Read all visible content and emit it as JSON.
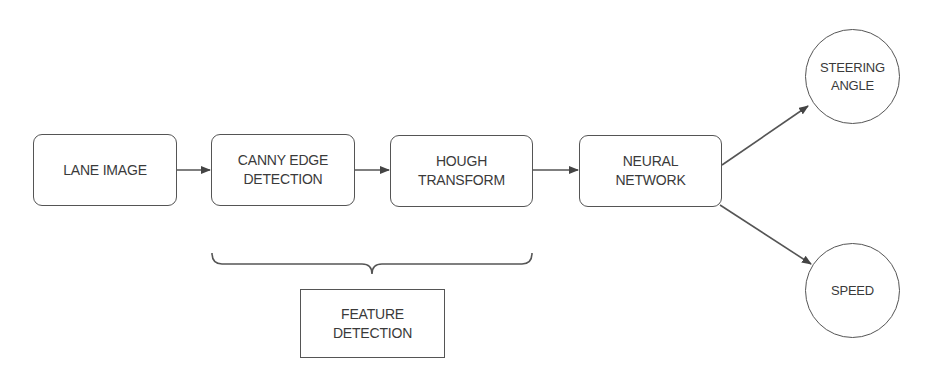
{
  "diagram": {
    "type": "flowchart",
    "nodes": [
      {
        "id": "lane_image",
        "label": "LANE IMAGE",
        "shape": "rounded-rect"
      },
      {
        "id": "canny",
        "label": "CANNY EDGE\nDETECTION",
        "shape": "rounded-rect"
      },
      {
        "id": "hough",
        "label": "HOUGH\nTRANSFORM",
        "shape": "rounded-rect"
      },
      {
        "id": "neural",
        "label": "NEURAL\nNETWORK",
        "shape": "rounded-rect"
      },
      {
        "id": "steering",
        "label": "STEERING\nANGLE",
        "shape": "circle"
      },
      {
        "id": "speed",
        "label": "SPEED",
        "shape": "circle"
      },
      {
        "id": "feature",
        "label": "FEATURE\nDETECTION",
        "shape": "rect"
      }
    ],
    "edges": [
      {
        "from": "lane_image",
        "to": "canny",
        "arrow": true
      },
      {
        "from": "canny",
        "to": "hough",
        "arrow": true
      },
      {
        "from": "hough",
        "to": "neural",
        "arrow": true
      },
      {
        "from": "neural",
        "to": "steering",
        "arrow": true
      },
      {
        "from": "neural",
        "to": "speed",
        "arrow": true
      }
    ],
    "groups": [
      {
        "members": [
          "canny",
          "hough"
        ],
        "connector": "curly-brace",
        "label_node": "feature"
      }
    ],
    "colors": {
      "stroke": "#555555",
      "text": "#3a3a3a",
      "background": "#ffffff"
    }
  }
}
